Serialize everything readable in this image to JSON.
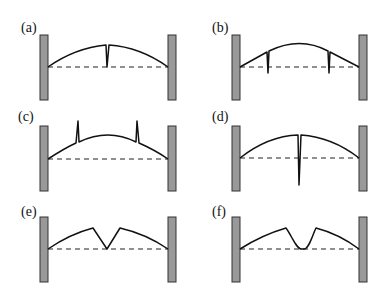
{
  "figure": {
    "panels": [
      {
        "id": "a",
        "label": "(a)",
        "feature": "single narrow downward cusp at center reaching the baseline"
      },
      {
        "id": "b",
        "label": "(b)",
        "feature": "two narrow downward spikes near the sides crossing slightly below the baseline"
      },
      {
        "id": "c",
        "label": "(c)",
        "feature": "two narrow upward spikes near the sides"
      },
      {
        "id": "d",
        "label": "(d)",
        "feature": "single narrow downward spike at center extending well below the baseline"
      },
      {
        "id": "e",
        "label": "(e)",
        "feature": "sharp V-shaped notch at center touching the baseline"
      },
      {
        "id": "f",
        "label": "(f)",
        "feature": "rounded U-shaped dip at center touching the baseline"
      }
    ],
    "colors": {
      "wall_fill": "#999999",
      "wall_stroke": "#333333",
      "line": "#111111"
    }
  }
}
